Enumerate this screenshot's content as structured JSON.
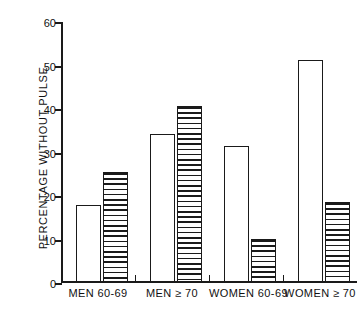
{
  "chart_data": {
    "type": "bar",
    "title": "",
    "subtitle": "",
    "xlabel": "",
    "ylabel": "PERCENTAGE WITHOUT PULSE",
    "ylim": [
      0,
      60
    ],
    "yticks": [
      0,
      10,
      20,
      30,
      40,
      50,
      60
    ],
    "ytick_labels": [
      "0",
      "10",
      "20",
      "30",
      "40",
      "50",
      "60"
    ],
    "grid": false,
    "legend_position": "none",
    "categories": [
      "MEN 60-69",
      "MEN ≥ 70",
      "WOMEN 60-69",
      "WOMEN ≥ 70"
    ],
    "series": [
      {
        "name": "open",
        "fill": "white",
        "values": [
          17.8,
          34.0,
          31.3,
          51.0
        ]
      },
      {
        "name": "hatched",
        "fill": "horizontal-hatch",
        "values": [
          25.3,
          40.5,
          9.9,
          18.4
        ]
      }
    ],
    "annotations": []
  },
  "axis": {
    "y_label_text": "PERCENTAGE WITHOUT PULSE",
    "tick_labels": [
      "60",
      "50",
      "40",
      "30",
      "20",
      "10",
      "0"
    ]
  },
  "xaxis": {
    "groups": [
      {
        "label": "MEN 60-69"
      },
      {
        "label": "MEN ≥ 70"
      },
      {
        "label": "WOMEN 60-69"
      },
      {
        "label": "WOMEN ≥ 70"
      }
    ]
  },
  "colors": {
    "ink": "#1a1a1a",
    "paper": "#ffffff"
  }
}
